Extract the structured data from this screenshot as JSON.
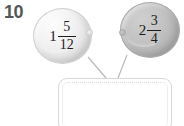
{
  "problem": {
    "number": "10",
    "type": "mixed-fraction-addition-balloons"
  },
  "balloons": [
    {
      "id": "balloon-1",
      "label": "1 5/12",
      "whole": "1",
      "numerator": "5",
      "denominator": "12",
      "fill_color": "#eeeeee",
      "shade": "light"
    },
    {
      "id": "balloon-2",
      "label": "2 3/4",
      "whole": "2",
      "numerator": "3",
      "denominator": "4",
      "fill_color": "#bdbdbd",
      "shade": "dark"
    }
  ],
  "answer_box": {
    "value": "",
    "placeholder": "",
    "border_color": "#d8d8d8",
    "inner_border_color": "#dcdcdc"
  },
  "connectors": {
    "line_color": "#b9b9b9",
    "count": 2
  },
  "colors": {
    "number_text": "#555658",
    "fraction_text": "#1c1c1c",
    "background": "#ffffff"
  }
}
